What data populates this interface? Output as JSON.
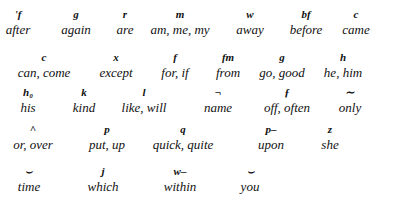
{
  "rows": [
    {
      "y": 8,
      "entries": [
        {
          "symbol": "'f",
          "word": "after",
          "x": 18
        },
        {
          "symbol": "g",
          "word": "again",
          "x": 76
        },
        {
          "symbol": "r",
          "word": "are",
          "x": 125
        },
        {
          "symbol": "m",
          "word": "am, me, my",
          "x": 180
        },
        {
          "symbol": "w",
          "word": "away",
          "x": 250
        },
        {
          "symbol": "bf",
          "word": "before",
          "x": 306
        },
        {
          "symbol": "c",
          "word": "came",
          "x": 356
        }
      ]
    },
    {
      "y": 51,
      "entries": [
        {
          "symbol": "c",
          "word": "can, come",
          "x": 44
        },
        {
          "symbol": "x",
          "word": "except",
          "x": 116
        },
        {
          "symbol": "f",
          "word": "for, if",
          "x": 175
        },
        {
          "symbol": "fm",
          "word": "from",
          "x": 228
        },
        {
          "symbol": "g",
          "word": "go, good",
          "x": 282
        },
        {
          "symbol": "h",
          "word": "he, him",
          "x": 343
        }
      ]
    },
    {
      "y": 86,
      "entries": [
        {
          "symbol": "h₀",
          "word": "his",
          "x": 28
        },
        {
          "symbol": "k",
          "word": "kind",
          "x": 84
        },
        {
          "symbol": "l",
          "word": "like, will",
          "x": 144
        },
        {
          "symbol": "¬",
          "word": "name",
          "x": 218
        },
        {
          "symbol": "ƒ",
          "word": "off, often",
          "x": 287
        },
        {
          "symbol": "∼",
          "word": "only",
          "x": 350
        }
      ]
    },
    {
      "y": 123,
      "entries": [
        {
          "symbol": "^",
          "word": "or, over",
          "x": 33
        },
        {
          "symbol": "p",
          "word": "put, up",
          "x": 107
        },
        {
          "symbol": "q",
          "word": "quick, quite",
          "x": 183
        },
        {
          "symbol": "p–",
          "word": "upon",
          "x": 271
        },
        {
          "symbol": "z",
          "word": "she",
          "x": 330
        }
      ]
    },
    {
      "y": 165,
      "entries": [
        {
          "symbol": "⌣",
          "word": "time",
          "x": 29
        },
        {
          "symbol": "j",
          "word": "which",
          "x": 103
        },
        {
          "symbol": "w–",
          "word": "within",
          "x": 180
        },
        {
          "symbol": "⌣",
          "word": "you",
          "x": 250
        }
      ]
    }
  ]
}
